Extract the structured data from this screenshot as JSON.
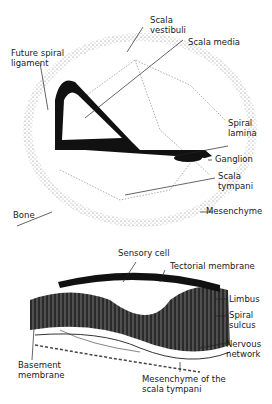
{
  "upper_diagram": {
    "labels": {
      "scala_vestibuli": "Scala\nvestibuli",
      "scala_media": "Scala media",
      "future_spiral_ligament": "Future spiral\nligament",
      "spiral_lamina": "Spiral\nlamina",
      "ganglion": "Ganglion",
      "scala_tympani": "Scala\ntympani",
      "bone": "Bone",
      "mesenchyme": "Mesenchyme"
    }
  },
  "lower_diagram": {
    "labels": {
      "sensory_cell": "Sensory cell",
      "tectorial_membrane": "Tectorial membrane",
      "limbus": "Limbus",
      "spiral_sulcus": "Spiral\nsulcus",
      "nervous_network": "Nervous\nnetwork",
      "basement_membrane": "Basement\nmembrane",
      "mesenchyme_scala_tympani": "Mesenchyme of the\nscala tympani"
    }
  },
  "colors": {
    "ink": "#111111",
    "stipple": "#8a8a8a",
    "background": "#ffffff"
  }
}
